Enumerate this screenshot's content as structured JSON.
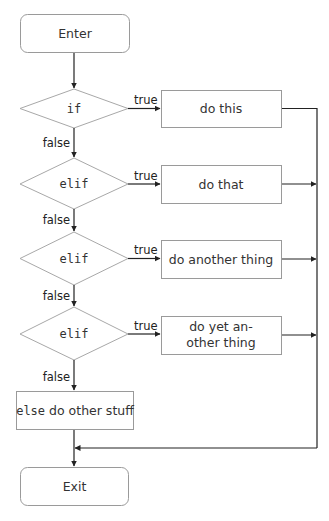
{
  "diagram": {
    "type": "flowchart",
    "start": {
      "label": "Enter"
    },
    "end": {
      "label": "Exit"
    },
    "conditions": [
      {
        "label": "if",
        "true_label": "true",
        "false_label": "false",
        "action": "do this"
      },
      {
        "label": "elif",
        "true_label": "true",
        "false_label": "false",
        "action": "do that"
      },
      {
        "label": "elif",
        "true_label": "true",
        "false_label": "false",
        "action": "do another thing"
      },
      {
        "label": "elif",
        "true_label": "true",
        "false_label": "false",
        "action_line1": "do yet an-",
        "action_line2": "other thing"
      }
    ],
    "else_box": {
      "keyword": "else",
      "text": " do other stuff"
    },
    "colors": {
      "node_stroke": "#9a9a9a",
      "edge": "#222222",
      "text": "#333333"
    }
  }
}
